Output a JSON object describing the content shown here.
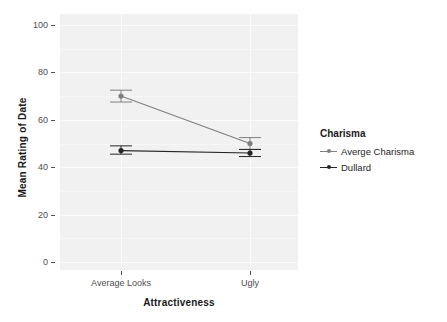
{
  "chart_data": {
    "type": "line",
    "title": "",
    "xlabel": "Attractiveness",
    "ylabel": "Mean Rating of Date",
    "categories": [
      "Average Looks",
      "Ugly"
    ],
    "ylim": [
      0,
      100
    ],
    "yticks": [
      0,
      20,
      40,
      60,
      80,
      100
    ],
    "ytick_labels": [
      "0",
      "20",
      "40",
      "60",
      "80",
      "100"
    ],
    "grid": true,
    "legend_position": "right",
    "legend_title": "Charisma",
    "series": [
      {
        "name": "Averge Charisma",
        "color": "#7f7f7f",
        "values": [
          70,
          50
        ],
        "error_low": [
          67.5,
          47.5
        ],
        "error_high": [
          72.5,
          52.5
        ]
      },
      {
        "name": "Dullard",
        "color": "#262626",
        "values": [
          47,
          46
        ],
        "error_low": [
          45.5,
          44.5
        ],
        "error_high": [
          49.0,
          47.5
        ]
      }
    ]
  },
  "panel": {
    "background_color": "#f1f1f1",
    "gridline_color": "#fbfbfb"
  },
  "axes": {
    "y": {
      "title": "Mean Rating of Date",
      "ticks": [
        "100",
        "80",
        "60",
        "40",
        "20",
        "0"
      ]
    },
    "x": {
      "title": "Attractiveness",
      "ticks": [
        "Average Looks",
        "Ugly"
      ]
    }
  },
  "legend": {
    "title": "Charisma",
    "items": [
      {
        "label": "Averge Charisma",
        "color": "#7f7f7f"
      },
      {
        "label": "Dullard",
        "color": "#262626"
      }
    ]
  }
}
